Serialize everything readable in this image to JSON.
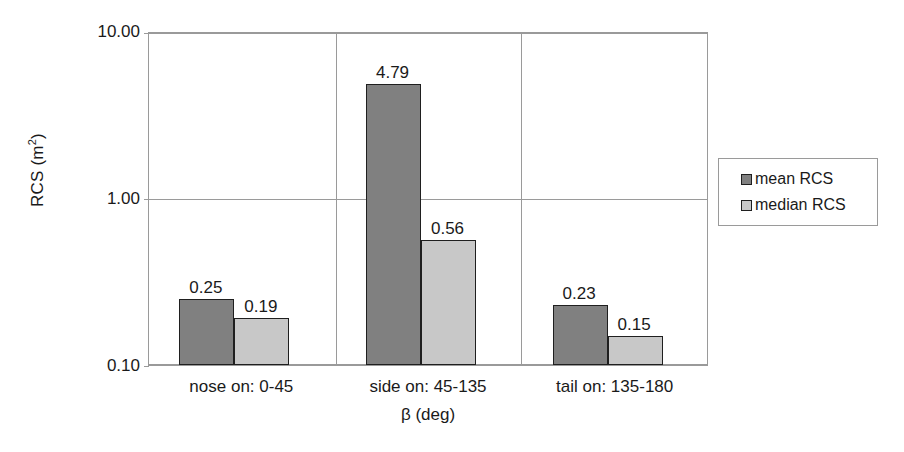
{
  "chart_data": {
    "type": "bar",
    "title": "",
    "xlabel": "β (deg)",
    "ylabel": "RCS (m²)",
    "ylabel_base": "RCS (m",
    "ylabel_sup": "2",
    "ylabel_tail": ")",
    "yscale": "log",
    "ylim": [
      0.1,
      10.0
    ],
    "grid": true,
    "legend_position": "right",
    "categories": [
      "nose on:  0-45",
      "side on: 45-135",
      "tail on: 135-180"
    ],
    "y_ticks": [
      {
        "label": "10.00",
        "value": 10.0
      },
      {
        "label": "1.00",
        "value": 1.0
      },
      {
        "label": "0.10",
        "value": 0.1
      }
    ],
    "series": [
      {
        "name": "mean RCS",
        "color": "#808080",
        "values": [
          0.25,
          4.79,
          0.23
        ],
        "labels": [
          "0.25",
          "4.79",
          "0.23"
        ]
      },
      {
        "name": "median RCS",
        "color": "#c8c8c8",
        "values": [
          0.19,
          0.56,
          0.15
        ],
        "labels": [
          "0.19",
          "0.56",
          "0.15"
        ]
      }
    ]
  },
  "legend": {
    "items": [
      {
        "label": "mean RCS",
        "swatch": "mean"
      },
      {
        "label": "median RCS",
        "swatch": "median"
      }
    ]
  },
  "colors": {
    "mean_bar": "#808080",
    "median_bar": "#c8c8c8",
    "axis": "#9a9a9a",
    "bar_outline": "#1f1f1f",
    "text": "#1a1a1a",
    "background": "#ffffff"
  }
}
